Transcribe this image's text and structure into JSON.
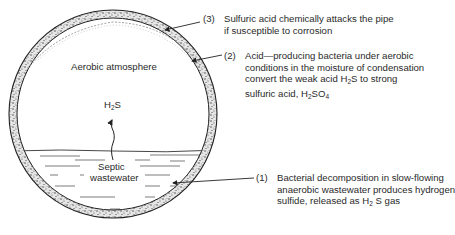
{
  "diagram": {
    "pipe": {
      "center_x": 113,
      "center_y": 114,
      "outer_radius": 104,
      "wall_thickness": 8,
      "water_level_y": 151
    },
    "labels": {
      "aerobic_atmosphere": "Aerobic atmosphere",
      "gas": {
        "base": "H",
        "sub": "2",
        "tail": "S"
      },
      "septic_line1": "Septic",
      "septic_line2": "wastewater"
    },
    "callouts": [
      {
        "number": "(3)",
        "lines": [
          "Sulfuric acid chemically attacks the pipe",
          "if susceptible to corrosion"
        ]
      },
      {
        "number": "(2)",
        "lines": [
          "Acid—producing bacteria under aerobic",
          "conditions in the moisture of condensation",
          "convert the weak acid H",
          "sulfuric acid, H"
        ],
        "line3_sub": "2",
        "line3_tail": "S to strong",
        "line4_sub1": "2",
        "line4_mid": "SO",
        "line4_sub2": "4"
      },
      {
        "number": "(1)",
        "lines": [
          "Bacterial decomposition in slow-flowing",
          "anaerobic wastewater produces hydrogen",
          "sulfide, released as H"
        ],
        "line3_sub": "2",
        "line3_tail": " S gas"
      }
    ]
  }
}
